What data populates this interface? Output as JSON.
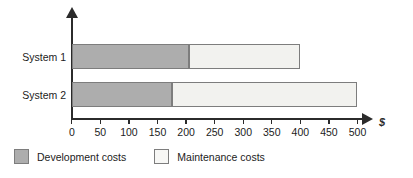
{
  "chart_data": {
    "type": "bar",
    "orientation": "horizontal",
    "stacked": true,
    "title": "",
    "xlabel": "$",
    "ylabel": "",
    "categories": [
      "System 1",
      "System 2"
    ],
    "series": [
      {
        "name": "Development costs",
        "values": [
          205,
          175
        ],
        "color": "#adadad"
      },
      {
        "name": "Maintenance costs",
        "values": [
          195,
          325
        ],
        "color": "#f2f2ef"
      }
    ],
    "totals": [
      400,
      500
    ],
    "xlim": [
      0,
      500
    ],
    "xticks": [
      0,
      50,
      100,
      150,
      200,
      250,
      300,
      350,
      400,
      450,
      500
    ],
    "xtick_labels": [
      "0",
      "50",
      "100",
      "150",
      "200",
      "250",
      "300",
      "350",
      "400",
      "450",
      "500"
    ],
    "grid": false,
    "legend_position": "bottom-left",
    "axis_color": "#2b2b2b",
    "bar_border_color": "#7d7d7d",
    "background": "#ffffff"
  },
  "axis": {
    "unit_symbol": "$",
    "x_arrow": "arrow-right-icon",
    "y_arrow": "arrow-up-icon"
  },
  "legend": {
    "items": [
      {
        "label": "Development costs",
        "swatch": "dark-gray-swatch"
      },
      {
        "label": "Maintenance costs",
        "swatch": "light-gray-swatch"
      }
    ]
  }
}
